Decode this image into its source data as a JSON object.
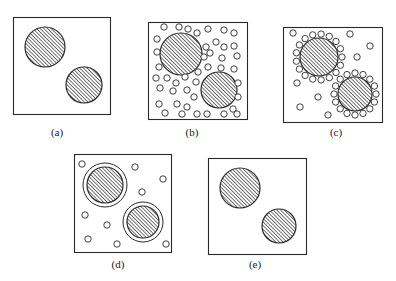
{
  "figure": {
    "colors": {
      "stroke": "#2a2a2a",
      "background": "#ffffff",
      "hatch": "#2a2a2a"
    },
    "panels": [
      {
        "id": "a",
        "label": "(a)",
        "label_pos": [
          57,
          133
        ],
        "box": [
          13,
          17,
          97,
          97
        ],
        "particles": [
          {
            "cx": 45,
            "cy": 47,
            "r": 20
          },
          {
            "cx": 84,
            "cy": 85,
            "r": 18
          }
        ],
        "rings": [],
        "small_circles": []
      },
      {
        "id": "b",
        "label": "(b)",
        "label_pos": [
          192,
          133
        ],
        "box": [
          148,
          22,
          99,
          97
        ],
        "particles": [
          {
            "cx": 181,
            "cy": 54,
            "r": 21
          },
          {
            "cx": 219,
            "cy": 90,
            "r": 18
          }
        ],
        "rings": [],
        "small_circles": [
          [
            164,
            27
          ],
          [
            179,
            27
          ],
          [
            188,
            29
          ],
          [
            197,
            33
          ],
          [
            208,
            29
          ],
          [
            224,
            30
          ],
          [
            234,
            33
          ],
          [
            157,
            39
          ],
          [
            216,
            42
          ],
          [
            224,
            47
          ],
          [
            234,
            46
          ],
          [
            157,
            52
          ],
          [
            206,
            47
          ],
          [
            210,
            53
          ],
          [
            204,
            57
          ],
          [
            222,
            58
          ],
          [
            237,
            56
          ],
          [
            159,
            67
          ],
          [
            208,
            67
          ],
          [
            221,
            68
          ],
          [
            234,
            69
          ],
          [
            156,
            78
          ],
          [
            167,
            78
          ],
          [
            185,
            77
          ],
          [
            198,
            72
          ],
          [
            238,
            83
          ],
          [
            160,
            88
          ],
          [
            176,
            83
          ],
          [
            196,
            82
          ],
          [
            173,
            91
          ],
          [
            187,
            90
          ],
          [
            194,
            97
          ],
          [
            238,
            97
          ],
          [
            159,
            104
          ],
          [
            177,
            104
          ],
          [
            187,
            107
          ],
          [
            233,
            109
          ],
          [
            165,
            113
          ],
          [
            182,
            114
          ],
          [
            197,
            114
          ],
          [
            207,
            114
          ],
          [
            224,
            114
          ],
          [
            237,
            114
          ]
        ]
      },
      {
        "id": "c",
        "label": "(c)",
        "label_pos": [
          336,
          133
        ],
        "box": [
          283,
          27,
          99,
          95
        ],
        "particles": [
          {
            "cx": 319,
            "cy": 57,
            "r": 19,
            "adsorbed_count": 17,
            "adsorbed_ring_r": 23
          },
          {
            "cx": 355,
            "cy": 94,
            "r": 17,
            "adsorbed_count": 16,
            "adsorbed_ring_r": 21
          }
        ],
        "rings": [],
        "small_circles": [
          [
            293,
            33
          ],
          [
            350,
            34
          ],
          [
            370,
            46
          ],
          [
            357,
            57
          ],
          [
            297,
            83
          ],
          [
            318,
            97
          ],
          [
            300,
            107
          ],
          [
            328,
            115
          ]
        ]
      },
      {
        "id": "d",
        "label": "(d)",
        "label_pos": [
          118,
          265
        ],
        "box": [
          74,
          154,
          97,
          98
        ],
        "particles": [
          {
            "cx": 105,
            "cy": 185,
            "r": 18
          },
          {
            "cx": 143,
            "cy": 222,
            "r": 16
          }
        ],
        "rings": [
          {
            "cx": 105,
            "cy": 185,
            "r": 22
          },
          {
            "cx": 143,
            "cy": 222,
            "r": 20
          }
        ],
        "small_circles": [
          [
            82,
            164
          ],
          [
            135,
            167
          ],
          [
            163,
            179
          ],
          [
            142,
            192
          ],
          [
            85,
            215
          ],
          [
            107,
            225
          ],
          [
            88,
            239
          ],
          [
            117,
            244
          ],
          [
            166,
            244
          ]
        ]
      },
      {
        "id": "e",
        "label": "(e)",
        "label_pos": [
          255,
          265
        ],
        "box": [
          208,
          158,
          98,
          96
        ],
        "particles": [
          {
            "cx": 240,
            "cy": 188,
            "r": 20
          },
          {
            "cx": 279,
            "cy": 226,
            "r": 17
          }
        ],
        "rings": [],
        "small_circles": []
      }
    ],
    "small_circle_r": 3.2
  }
}
